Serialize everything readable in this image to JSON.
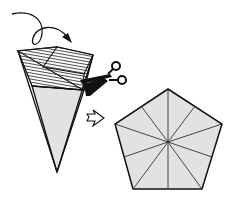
{
  "diagram": {
    "colors": {
      "paper_fill": "#e2e2e2",
      "outline": "#111111",
      "hatch": "#222222",
      "background": "#ffffff"
    },
    "steps": [
      {
        "name": "folded-cone",
        "note": "hatched top section, light grey lower section"
      },
      {
        "name": "scissors-cut",
        "note": "cut line across cone"
      },
      {
        "name": "result-pentagon",
        "note": "regular pentagon with 10 radial crease lines"
      }
    ]
  }
}
